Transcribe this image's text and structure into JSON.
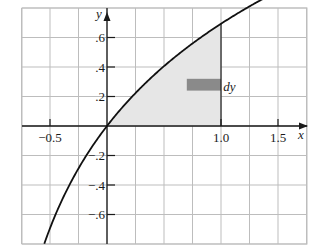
{
  "chart_data": {
    "type": "line",
    "title": "",
    "xlabel": "x",
    "ylabel": "y",
    "xlim": [
      -0.625,
      1.75
    ],
    "ylim": [
      -0.8,
      0.8
    ],
    "grid": true,
    "x_grid_step": 0.25,
    "y_grid_step": 0.2,
    "x_ticks": [
      {
        "value": -0.5,
        "label": "−0.5"
      },
      {
        "value": 1.0,
        "label": "1.0"
      },
      {
        "value": 1.5,
        "label": "1.5"
      }
    ],
    "y_ticks": [
      {
        "value": 0.6,
        "label": ".6"
      },
      {
        "value": 0.4,
        "label": ".4"
      },
      {
        "value": 0.2,
        "label": ".2"
      },
      {
        "value": -0.2,
        "label": "−.2"
      },
      {
        "value": -0.4,
        "label": "−.4"
      },
      {
        "value": -0.6,
        "label": "−.6"
      }
    ],
    "series": [
      {
        "name": "y = ln(1 + x)",
        "x": [
          -0.55,
          -0.5,
          -0.4,
          -0.3,
          -0.2,
          -0.1,
          0,
          0.1,
          0.2,
          0.3,
          0.4,
          0.5,
          0.6,
          0.7,
          0.8,
          0.9,
          1.0,
          1.1,
          1.2,
          1.3,
          1.4,
          1.5,
          1.6,
          1.7
        ],
        "y": [
          -0.799,
          -0.693,
          -0.511,
          -0.357,
          -0.223,
          -0.105,
          0,
          0.095,
          0.182,
          0.262,
          0.336,
          0.405,
          0.47,
          0.531,
          0.588,
          0.642,
          0.693,
          0.742,
          0.788,
          0.833,
          0.875,
          0.916,
          0.956,
          0.993
        ]
      }
    ],
    "shaded_region": {
      "description": "Region under curve between x = 0 and x = 1",
      "x_from": 0,
      "x_to": 1.0,
      "fill": "#e6e6e6"
    },
    "strip": {
      "label": "dy",
      "x_from": 0.7,
      "x_to": 1.0,
      "y_from": 0.24,
      "y_to": 0.32,
      "fill": "#8a8a8a"
    },
    "annotations": [
      {
        "text": "dy",
        "x": 1.02,
        "y": 0.28
      }
    ],
    "colors": {
      "grid": "#bdbdbd",
      "axis": "#1a1a1a",
      "curve": "#111111",
      "shade": "#e6e6e6",
      "strip": "#8a8a8a"
    }
  }
}
